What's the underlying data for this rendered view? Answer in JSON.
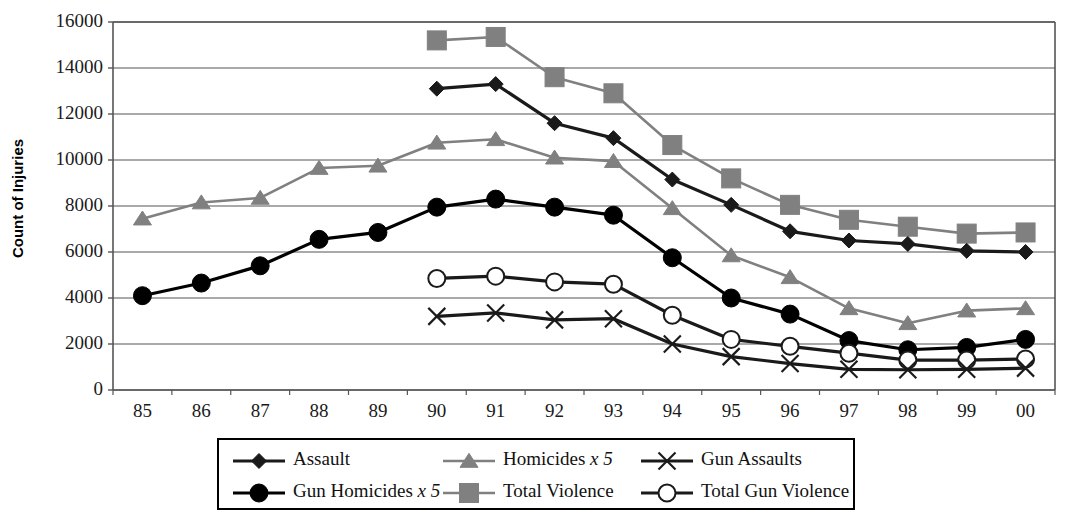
{
  "chart_data": {
    "type": "line",
    "title": "",
    "xlabel": "",
    "ylabel": "Count of Injuries",
    "categories": [
      "85",
      "86",
      "87",
      "88",
      "89",
      "90",
      "91",
      "92",
      "93",
      "94",
      "95",
      "96",
      "97",
      "98",
      "99",
      "00"
    ],
    "ylim": [
      0,
      16000
    ],
    "ytick_values": [
      0,
      2000,
      4000,
      6000,
      8000,
      10000,
      12000,
      14000,
      16000
    ],
    "ytick_labels": [
      "0",
      "2000",
      "4000",
      "6000",
      "8000",
      "10000",
      "12000",
      "14000",
      "16000"
    ],
    "grid": true,
    "grid_axis": "y",
    "legend_position": "bottom",
    "series": [
      {
        "name": "Assault",
        "marker": "diamond",
        "color": "#1a1a1a",
        "values": [
          null,
          null,
          null,
          null,
          null,
          13100,
          13300,
          11600,
          10950,
          9150,
          8050,
          6900,
          6500,
          6350,
          6050,
          6000
        ]
      },
      {
        "name": "Homicides x 5",
        "marker": "triangle",
        "color": "#808080",
        "values": [
          7450,
          8150,
          8350,
          9650,
          9750,
          10750,
          10900,
          10100,
          9950,
          7900,
          5850,
          4900,
          3550,
          2900,
          3450,
          3550
        ]
      },
      {
        "name": "Gun Assaults",
        "marker": "x",
        "color": "#1a1a1a",
        "values": [
          null,
          null,
          null,
          null,
          null,
          3200,
          3350,
          3050,
          3100,
          2000,
          1450,
          1150,
          900,
          880,
          900,
          950
        ]
      },
      {
        "name": "Gun Homicides x 5",
        "marker": "circle-filled",
        "color": "#000000",
        "values": [
          4100,
          4650,
          5400,
          6550,
          6850,
          7950,
          8300,
          7950,
          7600,
          5750,
          4000,
          3300,
          2150,
          1750,
          1850,
          2200
        ]
      },
      {
        "name": "Total Violence",
        "marker": "square",
        "color": "#808080",
        "values": [
          null,
          null,
          null,
          null,
          null,
          15200,
          15350,
          13600,
          12900,
          10650,
          9200,
          8050,
          7400,
          7100,
          6800,
          6850
        ]
      },
      {
        "name": "Total Gun Violence",
        "marker": "circle-open",
        "color": "#1a1a1a",
        "values": [
          null,
          null,
          null,
          null,
          null,
          4850,
          4950,
          4700,
          4600,
          3250,
          2200,
          1900,
          1600,
          1300,
          1300,
          1350
        ]
      }
    ]
  },
  "legend": {
    "entries": [
      {
        "label": "Assault",
        "marker": "diamond",
        "color": "#1a1a1a"
      },
      {
        "label": "Homicides x 5",
        "marker": "triangle",
        "color": "#808080"
      },
      {
        "label": "Gun Assaults",
        "marker": "x",
        "color": "#1a1a1a"
      },
      {
        "label": "Gun Homicides x 5",
        "marker": "circle-filled",
        "color": "#000000"
      },
      {
        "label": "Total Violence",
        "marker": "square",
        "color": "#808080"
      },
      {
        "label": "Total Gun Violence",
        "marker": "circle-open",
        "color": "#1a1a1a"
      }
    ]
  },
  "plot_area": {
    "left": 113,
    "top": 22,
    "right": 1055,
    "bottom": 390
  },
  "colors": {
    "axis": "#555555",
    "grid": "#555555",
    "dark_series": "#1a1a1a",
    "gray_series": "#808080",
    "black_series": "#000000",
    "text": "#111111"
  }
}
